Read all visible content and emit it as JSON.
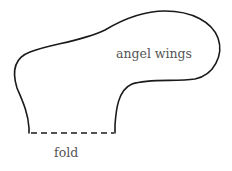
{
  "diagram": {
    "type": "pattern-template",
    "shape_label": "angel wings",
    "fold_label": "fold",
    "colors": {
      "outline": "#1a1a1a",
      "text": "#555555",
      "background": "#ffffff"
    }
  }
}
